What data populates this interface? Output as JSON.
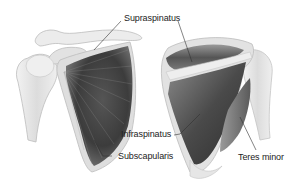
{
  "diagram": {
    "views": [
      {
        "id": "anterior",
        "description": "Front view of right shoulder: humerus, clavicle, coracoid and subscapularis on scapula"
      },
      {
        "id": "posterior",
        "description": "Back view of right shoulder: scapula with supraspinatus, infraspinatus, teres minor, humerus"
      }
    ],
    "labels": {
      "supraspinatus": "Supraspinatus",
      "infraspinatus": "Infraspinatus",
      "subscapularis": "Subscapularis",
      "teres_minor": "Teres minor"
    },
    "colors": {
      "bone": "#e6e6e6",
      "bone_edge": "#b8b8b8",
      "muscle_dark": "#3a3a3a",
      "muscle_mid": "#6e6e6e",
      "muscle_light": "#a8a8a8",
      "leader_line": "#333333",
      "label_text": "#222222"
    }
  }
}
